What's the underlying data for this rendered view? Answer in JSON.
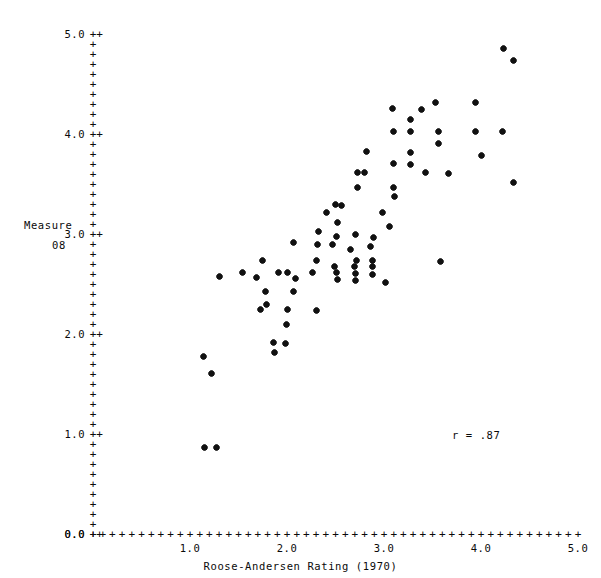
{
  "chart_data": {
    "type": "scatter",
    "title": "",
    "xlabel": "Roose-Andersen Rating (1970)",
    "ylabel_line1": "Measure",
    "ylabel_line2": "08",
    "annotation": "r = .87",
    "correlation": 0.87,
    "xlim": [
      0.0,
      5.0
    ],
    "ylim": [
      0.0,
      5.0
    ],
    "grid": false,
    "legend": null,
    "x_major_ticks": [
      0.0,
      1.0,
      2.0,
      3.0,
      4.0,
      5.0
    ],
    "y_major_ticks": [
      0.0,
      1.0,
      2.0,
      3.0,
      4.0,
      5.0
    ],
    "x_tick_labels": [
      "0.0",
      "1.0",
      "2.0",
      "3.0",
      "4.0",
      "5.0"
    ],
    "y_tick_labels": [
      "0.0",
      "1.0",
      "2.0",
      "3.0",
      "4.0",
      "5.0"
    ],
    "minor_tick_step": 0.1,
    "tick_glyph": "+",
    "marker": "*",
    "marker_color": "#111111",
    "points": [
      [
        4.23,
        4.86
      ],
      [
        4.34,
        4.74
      ],
      [
        3.53,
        4.32
      ],
      [
        3.94,
        4.32
      ],
      [
        3.09,
        4.26
      ],
      [
        3.39,
        4.25
      ],
      [
        3.27,
        4.15
      ],
      [
        3.1,
        4.03
      ],
      [
        3.27,
        4.03
      ],
      [
        3.56,
        4.03
      ],
      [
        3.94,
        4.03
      ],
      [
        4.22,
        4.03
      ],
      [
        3.56,
        3.91
      ],
      [
        2.82,
        3.83
      ],
      [
        3.27,
        3.82
      ],
      [
        4.0,
        3.79
      ],
      [
        3.1,
        3.71
      ],
      [
        3.27,
        3.7
      ],
      [
        2.8,
        3.62
      ],
      [
        2.73,
        3.62
      ],
      [
        3.43,
        3.62
      ],
      [
        3.66,
        3.61
      ],
      [
        4.34,
        3.52
      ],
      [
        2.73,
        3.47
      ],
      [
        3.1,
        3.47
      ],
      [
        3.11,
        3.38
      ],
      [
        2.5,
        3.3
      ],
      [
        2.56,
        3.29
      ],
      [
        2.41,
        3.22
      ],
      [
        2.98,
        3.22
      ],
      [
        2.52,
        3.12
      ],
      [
        3.06,
        3.08
      ],
      [
        2.32,
        3.03
      ],
      [
        2.71,
        3.0
      ],
      [
        2.51,
        2.98
      ],
      [
        2.89,
        2.97
      ],
      [
        2.07,
        2.92
      ],
      [
        2.31,
        2.9
      ],
      [
        2.47,
        2.9
      ],
      [
        2.86,
        2.88
      ],
      [
        2.65,
        2.85
      ],
      [
        3.58,
        2.73
      ],
      [
        1.75,
        2.74
      ],
      [
        2.3,
        2.74
      ],
      [
        2.72,
        2.74
      ],
      [
        2.88,
        2.74
      ],
      [
        2.49,
        2.68
      ],
      [
        2.7,
        2.68
      ],
      [
        2.88,
        2.68
      ],
      [
        1.54,
        2.62
      ],
      [
        1.91,
        2.62
      ],
      [
        2.0,
        2.62
      ],
      [
        2.26,
        2.62
      ],
      [
        2.51,
        2.62
      ],
      [
        2.71,
        2.61
      ],
      [
        2.88,
        2.6
      ],
      [
        1.3,
        2.58
      ],
      [
        1.69,
        2.57
      ],
      [
        2.09,
        2.56
      ],
      [
        2.52,
        2.55
      ],
      [
        2.71,
        2.54
      ],
      [
        3.02,
        2.52
      ],
      [
        1.78,
        2.43
      ],
      [
        2.07,
        2.43
      ],
      [
        1.79,
        2.3
      ],
      [
        1.73,
        2.25
      ],
      [
        2.0,
        2.25
      ],
      [
        2.3,
        2.24
      ],
      [
        1.99,
        2.1
      ],
      [
        1.86,
        1.92
      ],
      [
        1.98,
        1.91
      ],
      [
        1.87,
        1.82
      ],
      [
        1.14,
        1.78
      ],
      [
        1.22,
        1.61
      ],
      [
        1.15,
        0.87
      ],
      [
        1.27,
        0.87
      ]
    ]
  },
  "layout": {
    "plot_left_px": 93,
    "plot_bottom_px": 534,
    "plot_top_px": 34,
    "plot_right_px": 578
  }
}
